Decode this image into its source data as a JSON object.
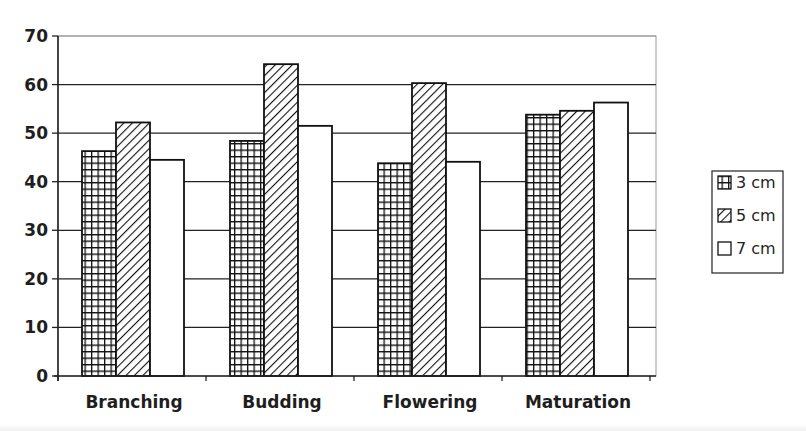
{
  "chart_data": {
    "type": "bar",
    "title": "",
    "xlabel": "",
    "ylabel": "",
    "categories": [
      "Branching",
      "Budding",
      "Flowering",
      "Maturation"
    ],
    "series": [
      {
        "name": "3 cm",
        "pattern": "grid",
        "values": [
          46.3,
          48.4,
          43.8,
          53.8
        ]
      },
      {
        "name": "5 cm",
        "pattern": "diagonal-hatch",
        "values": [
          52.2,
          64.2,
          60.3,
          54.6
        ]
      },
      {
        "name": "7 cm",
        "pattern": "white",
        "values": [
          44.5,
          51.5,
          44.1,
          56.3
        ]
      }
    ],
    "ylim": [
      0,
      70
    ],
    "yticks": [
      0,
      10,
      20,
      30,
      40,
      50,
      60,
      70
    ],
    "grid": true,
    "legend_position": "right"
  },
  "legend": {
    "items": [
      {
        "label": "3 cm",
        "icon": "grid-pattern-swatch"
      },
      {
        "label": "5 cm",
        "icon": "hatch-pattern-swatch"
      },
      {
        "label": "7 cm",
        "icon": "white-swatch"
      }
    ]
  },
  "colors": {
    "bar_stroke": "#111111",
    "grid": "#222222",
    "plot_border": "#9a9a9a",
    "fill_white": "#ffffff"
  }
}
